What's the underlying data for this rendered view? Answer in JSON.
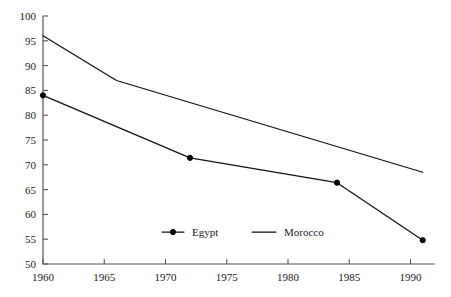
{
  "chart_data": {
    "type": "line",
    "title": "",
    "subtitle": "",
    "xlabel": "",
    "ylabel": "",
    "xlim": [
      1960,
      1992
    ],
    "ylim": [
      50,
      100
    ],
    "grid": false,
    "legend_position": "bottom-center",
    "x_ticks": [
      1960,
      1965,
      1970,
      1975,
      1980,
      1985,
      1990
    ],
    "x_tick_labels": [
      "1960",
      "1965",
      "1970",
      "1975",
      "1980",
      "1985",
      "1990"
    ],
    "y_ticks": [
      50,
      55,
      60,
      65,
      70,
      75,
      80,
      85,
      90,
      95,
      100
    ],
    "y_tick_labels": [
      "50",
      "55",
      "60",
      "65",
      "70",
      "75",
      "80",
      "85",
      "90",
      "95",
      "100"
    ],
    "series": [
      {
        "name": "Egypt",
        "color": "#111111",
        "marker": "circle",
        "x": [
          1960,
          1972,
          1984,
          1991
        ],
        "values": [
          84,
          71.4,
          66.4,
          54.8
        ]
      },
      {
        "name": "Morocco",
        "color": "#111111",
        "marker": "none",
        "x": [
          1960,
          1966,
          1991
        ],
        "values": [
          96,
          87,
          68.5
        ]
      }
    ]
  },
  "legend": {
    "entries": [
      {
        "label": "Egypt",
        "marker": "line-with-dot"
      },
      {
        "label": "Morocco",
        "marker": "line"
      }
    ]
  }
}
